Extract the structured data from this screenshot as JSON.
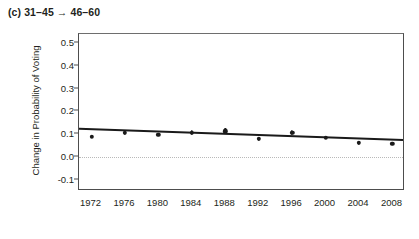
{
  "figure": {
    "panel_title": "(c) 31–45 → 46–60"
  },
  "chart_data": {
    "type": "scatter",
    "title": "(c) 31–45 → 46–60",
    "xlabel": "",
    "ylabel": "Change in Probability of Voting",
    "categories": [
      "1972",
      "1976",
      "1980",
      "1984",
      "1988",
      "1992",
      "1996",
      "2000",
      "2004",
      "2008"
    ],
    "x": [
      1972,
      1976,
      1980,
      1984,
      1988,
      1992,
      1996,
      2000,
      2004,
      2008
    ],
    "values": [
      0.088,
      0.105,
      0.096,
      0.105,
      0.113,
      0.079,
      0.105,
      0.083,
      0.063,
      0.058
    ],
    "error_low": [
      0.088,
      0.096,
      0.092,
      0.096,
      0.1,
      0.071,
      0.096,
      0.079,
      0.054,
      0.05
    ],
    "error_high": [
      0.088,
      0.117,
      0.1,
      0.117,
      0.125,
      0.088,
      0.117,
      0.092,
      0.071,
      0.067
    ],
    "trendline": {
      "x": [
        1970.5,
        2009.5
      ],
      "y": [
        0.121,
        0.071
      ],
      "style": "solid",
      "color": "#1a1a1a"
    },
    "reference_line": {
      "y": 0.0,
      "style": "dotted",
      "color": "#b9b9b9"
    },
    "ylim": [
      -0.15,
      0.54
    ],
    "xlim": [
      1970.5,
      2009.5
    ],
    "ytick_labels": [
      "0.5",
      "0.4",
      "0.3",
      "0.2",
      "0.1",
      "0.0",
      "-0.1"
    ],
    "ytick_values": [
      0.5,
      0.4,
      0.3,
      0.2,
      0.1,
      0.0,
      -0.1
    ],
    "xtick_labels": [
      "1972",
      "1976",
      "1980",
      "1984",
      "1988",
      "1992",
      "1996",
      "2000",
      "2004",
      "2008"
    ],
    "grid": false,
    "legend": null,
    "marker_color": "#1a1a1a",
    "frame_color": "#4d4d4d"
  }
}
